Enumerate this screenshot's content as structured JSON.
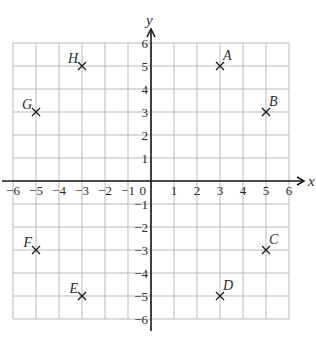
{
  "diagram": {
    "type": "coordinate-grid",
    "x_axis_label": "x",
    "y_axis_label": "y",
    "origin_label": "0",
    "x_range": [
      -6,
      6
    ],
    "y_range": [
      -6,
      6
    ],
    "x_ticks": [
      "−6",
      "−5",
      "−4",
      "−3",
      "−2",
      "−1",
      "1",
      "2",
      "3",
      "4",
      "5",
      "6"
    ],
    "y_ticks": [
      "6",
      "5",
      "4",
      "3",
      "2",
      "1",
      "−1",
      "−2",
      "−3",
      "−4",
      "−5",
      "−6"
    ],
    "points": [
      {
        "label": "A",
        "x": 3,
        "y": 5
      },
      {
        "label": "B",
        "x": 5,
        "y": 3
      },
      {
        "label": "C",
        "x": 5,
        "y": -3
      },
      {
        "label": "D",
        "x": 3,
        "y": -5
      },
      {
        "label": "E",
        "x": -3,
        "y": -5
      },
      {
        "label": "F",
        "x": -5,
        "y": -3
      },
      {
        "label": "G",
        "x": -5,
        "y": 3
      },
      {
        "label": "H",
        "x": -3,
        "y": 5
      }
    ],
    "colors": {
      "grid": "#b8b8b8",
      "axis": "#1a1a1a",
      "text": "#2a2a2a",
      "marker": "#1a1a1a"
    }
  }
}
